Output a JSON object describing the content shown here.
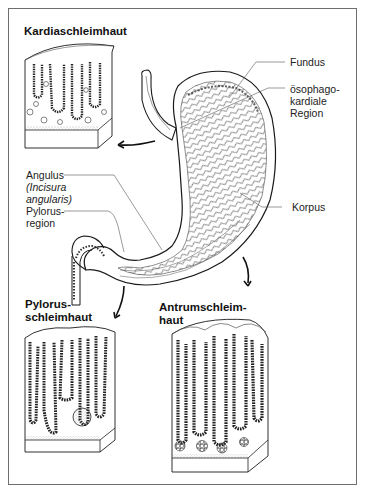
{
  "diagram": {
    "panels": {
      "cardia": {
        "title": "Kardiaschleimhaut"
      },
      "pylorus": {
        "title_lines": [
          "Pylorus-",
          "schleimhaut"
        ]
      },
      "antrum": {
        "title_lines": [
          "Antrumschleim-",
          "haut"
        ]
      }
    },
    "labels": {
      "fundus": "Fundus",
      "esophageal_cardiac": [
        "ösophago-",
        "kardiale",
        "Region"
      ],
      "angulus": "Angulus",
      "angulus_latin": [
        "(Incisura",
        "angularis)"
      ],
      "pylorus_region": [
        "Pylorus-",
        "region"
      ],
      "korpus": "Korpus"
    },
    "colors": {
      "line": "#1a1a1a",
      "leader": "#555555",
      "frame": "#6e6e6e",
      "shade": "#9a9a9a",
      "background": "#ffffff"
    }
  }
}
